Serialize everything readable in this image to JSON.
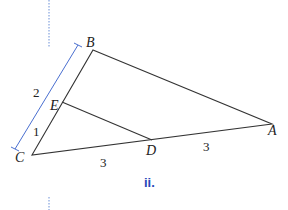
{
  "figure": {
    "caption": "ii.",
    "points": {
      "A": "A",
      "B": "B",
      "C": "C",
      "D": "D",
      "E": "E"
    },
    "lengths": {
      "BE": "2",
      "EC": "1",
      "CD": "3",
      "DA": "3"
    },
    "colors": {
      "lines": "#333333",
      "bracket": "#4a6fd0",
      "caption": "#2a47b8",
      "dotted": "#6b8fd6"
    }
  }
}
